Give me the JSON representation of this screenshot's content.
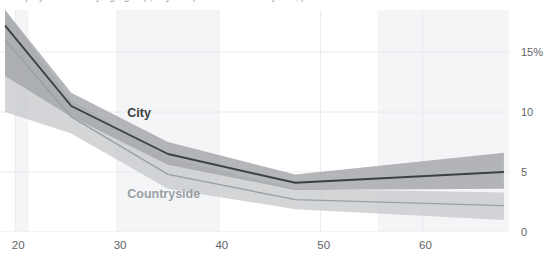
{
  "title_fragment": "unemployment rate by age group, city compared with countryside, percent of labour force",
  "axes": {
    "y_ticks": [
      {
        "label": "15%",
        "value": 15
      },
      {
        "label": "10",
        "value": 10
      },
      {
        "label": "5",
        "value": 5
      },
      {
        "label": "0",
        "value": 0
      }
    ],
    "x_ticks": [
      {
        "label": "20",
        "value": 20
      },
      {
        "label": "30",
        "value": 30
      },
      {
        "label": "40",
        "value": 40
      },
      {
        "label": "50",
        "value": 50
      },
      {
        "label": "60",
        "value": 60
      }
    ]
  },
  "labels": {
    "city": "City",
    "countryside": "Countryside"
  },
  "colors": {
    "city_line": "#3c4043",
    "city_band": "#a3a6a9",
    "countryside_line": "#9aa0a6",
    "countryside_band": "#c9ccce",
    "gridline": "#e8eaed",
    "shade_band": "#f4f5f6",
    "tick_text": "#5f6368",
    "background": "#ffffff"
  },
  "chart_data": {
    "type": "line",
    "title": "",
    "xlabel": "",
    "ylabel": "",
    "xlim": [
      18.5,
      68.5
    ],
    "ylim": [
      0,
      18.5
    ],
    "grid": true,
    "legend": "inline-labels",
    "y_unit": "%",
    "x": [
      19,
      25.5,
      35,
      47.5,
      68
    ],
    "series": [
      {
        "name": "City",
        "color": "#3c4043",
        "values": [
          17.2,
          10.5,
          6.5,
          4.1,
          5.0
        ],
        "band_low": [
          13.0,
          9.6,
          5.6,
          3.5,
          3.6
        ],
        "band_high": [
          18.5,
          11.6,
          7.5,
          4.8,
          6.6
        ]
      },
      {
        "name": "Countryside",
        "color": "#9aa0a6",
        "values": [
          16.0,
          9.6,
          4.8,
          2.7,
          2.2
        ],
        "band_low": [
          10.0,
          8.2,
          3.6,
          1.9,
          1.0
        ],
        "band_high": [
          18.5,
          11.0,
          6.2,
          3.6,
          3.3
        ]
      }
    ],
    "shaded_x_bands": [
      {
        "from": 20.0,
        "to": 21.3
      },
      {
        "from": 30.0,
        "to": 40.0
      },
      {
        "from": 55.6,
        "to": 68.5
      }
    ],
    "annotations": [
      {
        "text": "City",
        "x": 31,
        "y": 9.8
      },
      {
        "text": "Countryside",
        "x": 31,
        "y": 3.1
      }
    ]
  }
}
